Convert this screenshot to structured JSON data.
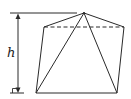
{
  "diagram": {
    "height_label": "h",
    "colors": {
      "stroke": "#2a2a2a",
      "background": "#ffffff"
    },
    "points": {
      "apex": [
        84,
        13
      ],
      "back_left": [
        44,
        27
      ],
      "back_right": [
        124,
        27
      ],
      "front_left": [
        36,
        93
      ],
      "front_right": [
        117,
        93
      ]
    },
    "edges": {
      "solid": [
        [
          "apex",
          "back_left"
        ],
        [
          "apex",
          "back_right"
        ],
        [
          "apex",
          "front_left"
        ],
        [
          "apex",
          "front_right"
        ],
        [
          "back_left",
          "front_left"
        ],
        [
          "back_right",
          "front_right"
        ],
        [
          "front_left",
          "front_right"
        ]
      ],
      "dashed": [
        [
          "back_left",
          "back_right"
        ]
      ]
    },
    "height_indicator": {
      "top_y": 13,
      "bottom_y": 93,
      "x": 18,
      "right_angle_marker": true
    }
  }
}
